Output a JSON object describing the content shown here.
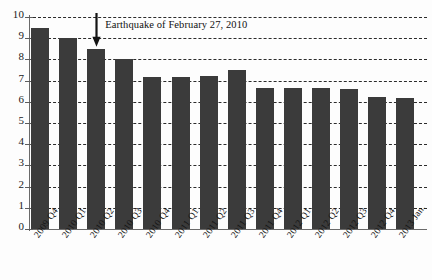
{
  "chart_data": {
    "type": "bar",
    "title": "",
    "subtitle": "",
    "xlabel": "",
    "ylabel": "",
    "ylim": [
      0,
      10
    ],
    "ytick_step": 1,
    "yticks": [
      0,
      1,
      2,
      3,
      4,
      5,
      6,
      7,
      8,
      9,
      10
    ],
    "ytick_labels": [
      "0",
      "1",
      "2",
      "3",
      "4",
      "5",
      "6",
      "7",
      "8",
      "9",
      "10"
    ],
    "grid": "horizontal-dashed",
    "legend": "none",
    "bar_color": "#3b3b3b",
    "categories": [
      "2009 Q4",
      "2010 Q1",
      "2010 Q2",
      "2010 Q3",
      "2010 Q4",
      "2011 Q1",
      "2011 Q2",
      "2011 Q3",
      "2011 Q4",
      "2012 Q1",
      "2012 Q2",
      "2012 Q3",
      "2012 Q4",
      "2013 Jan."
    ],
    "values": [
      9.5,
      9.0,
      8.5,
      8.0,
      7.15,
      7.15,
      7.2,
      7.5,
      6.65,
      6.65,
      6.65,
      6.6,
      6.25,
      6.2
    ],
    "annotations": [
      {
        "text": "Earthquake of February 27, 2010",
        "points_to_category": "2010 Q2",
        "marker": "down-arrow"
      }
    ]
  }
}
